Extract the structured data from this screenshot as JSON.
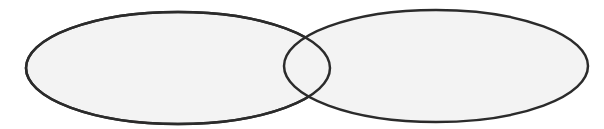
{
  "diagram": {
    "type": "venn",
    "sets": [
      {
        "id": "left",
        "label": "",
        "cx": 178,
        "cy": 68,
        "rx": 152,
        "ry": 56
      },
      {
        "id": "right",
        "label": "",
        "cx": 436,
        "cy": 66,
        "rx": 152,
        "ry": 56
      }
    ],
    "colors": {
      "background": "#ffffff",
      "fill": "#f3f3f3",
      "stroke": "#2b2b2b"
    },
    "stroke_width": 2.5
  }
}
